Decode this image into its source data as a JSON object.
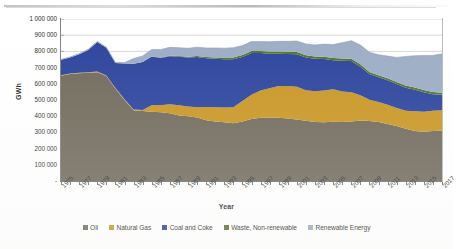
{
  "chart_data": {
    "type": "area",
    "stacked": true,
    "title": "",
    "xlabel": "Year",
    "ylabel": "GWh",
    "ylim": [
      0,
      1000000
    ],
    "ytick_labels": [
      "1 000 000",
      "900 000",
      "800 000",
      "700 000",
      "600 000",
      "500 000",
      "400 000",
      "300 000",
      "200 000",
      "100 000",
      "-"
    ],
    "ytick_values": [
      1000000,
      900000,
      800000,
      700000,
      600000,
      500000,
      400000,
      300000,
      200000,
      100000,
      0
    ],
    "grid": true,
    "legend_position": "bottom",
    "x_tick_labels": [
      "1975",
      "1977",
      "1979",
      "1981",
      "1983",
      "1985",
      "1987",
      "1989",
      "1991",
      "1993",
      "1995",
      "1997",
      "1999",
      "2001",
      "2003",
      "2005",
      "2007",
      "2009",
      "2011",
      "2013",
      "2015",
      "2017"
    ],
    "x": [
      1975,
      1976,
      1977,
      1978,
      1979,
      1980,
      1981,
      1982,
      1983,
      1984,
      1985,
      1986,
      1987,
      1988,
      1989,
      1990,
      1991,
      1992,
      1993,
      1994,
      1995,
      1996,
      1997,
      1998,
      1999,
      2000,
      2001,
      2002,
      2003,
      2004,
      2005,
      2006,
      2007,
      2008,
      2009,
      2010,
      2011,
      2012,
      2013,
      2014,
      2015,
      2016,
      2017
    ],
    "series": [
      {
        "name": "Oil",
        "color": "#6e6759",
        "values": [
          650000,
          660000,
          665000,
          668000,
          672000,
          648000,
          570000,
          500000,
          437000,
          432000,
          428000,
          424000,
          418000,
          405000,
          400000,
          392000,
          375000,
          368000,
          362000,
          356000,
          368000,
          382000,
          390000,
          392000,
          390000,
          386000,
          380000,
          372000,
          364000,
          363000,
          366000,
          364000,
          368000,
          374000,
          370000,
          364000,
          352000,
          340000,
          322000,
          308000,
          304000,
          308000,
          310000
        ]
      },
      {
        "name": "Natural Gas",
        "color": "#c8941e",
        "values": [
          3000,
          3000,
          3500,
          4000,
          4000,
          4000,
          4000,
          4000,
          5000,
          6000,
          40000,
          44000,
          56000,
          62000,
          60000,
          64000,
          82000,
          88000,
          92000,
          100000,
          126000,
          150000,
          168000,
          180000,
          196000,
          200000,
          202000,
          188000,
          190000,
          196000,
          200000,
          188000,
          180000,
          156000,
          132000,
          124000,
          118000,
          110000,
          112000,
          122000,
          124000,
          126000,
          126000
        ]
      },
      {
        "name": "Coal and Coke",
        "color": "#27409b",
        "values": [
          96000,
          100000,
          114000,
          136000,
          182000,
          170000,
          154000,
          222000,
          282000,
          296000,
          300000,
          292000,
          296000,
          300000,
          302000,
          310000,
          300000,
          298000,
          298000,
          296000,
          272000,
          258000,
          232000,
          214000,
          200000,
          198000,
          200000,
          202000,
          200000,
          194000,
          180000,
          190000,
          192000,
          176000,
          158000,
          152000,
          152000,
          148000,
          142000,
          134000,
          120000,
          102000,
          96000
        ]
      },
      {
        "name": "Waste, Non-renewable",
        "color": "#4a7322",
        "values": [
          0,
          0,
          0,
          0,
          0,
          0,
          0,
          0,
          0,
          0,
          0,
          2000,
          3000,
          4000,
          5000,
          6000,
          8000,
          9000,
          10000,
          11000,
          12000,
          13000,
          13000,
          14000,
          14000,
          14000,
          14000,
          14000,
          14000,
          14000,
          14000,
          14000,
          14000,
          14000,
          13000,
          13000,
          13000,
          13000,
          13000,
          13000,
          13000,
          13000,
          13000
        ]
      },
      {
        "name": "Renewable Energy",
        "color": "#9aabc4",
        "values": [
          2000,
          3000,
          4000,
          5000,
          4000,
          4000,
          4000,
          5000,
          32000,
          38000,
          44000,
          50000,
          52000,
          52000,
          52000,
          54000,
          56000,
          58000,
          58000,
          60000,
          58000,
          58000,
          58000,
          60000,
          62000,
          64000,
          68000,
          70000,
          72000,
          78000,
          82000,
          98000,
          112000,
          120000,
          122000,
          126000,
          136000,
          152000,
          180000,
          196000,
          214000,
          226000,
          240000
        ]
      }
    ],
    "series_totals": [
      751000,
      766000,
      786500,
      813000,
      862000,
      826000,
      732000,
      731000,
      756000,
      772000,
      812000,
      812000,
      825000,
      823000,
      819000,
      826000,
      821000,
      821000,
      820000,
      823000,
      836000,
      861000,
      861000,
      860000,
      862000,
      862000,
      864000,
      846000,
      840000,
      845000,
      842000,
      854000,
      866000,
      840000,
      795000,
      779000,
      771000,
      763000,
      769000,
      773000,
      775000,
      775000,
      785000
    ]
  },
  "axes": {
    "ylabel": "GWh",
    "xlabel": "Year"
  },
  "legend": {
    "items": [
      {
        "label": "Oil",
        "color": "#6e6759"
      },
      {
        "label": "Natural Gas",
        "color": "#c8941e"
      },
      {
        "label": "Coal and Coke",
        "color": "#27409b"
      },
      {
        "label": "Waste, Non-renewable",
        "color": "#4a7322"
      },
      {
        "label": "Renewable Energy",
        "color": "#9aabc4"
      }
    ]
  }
}
